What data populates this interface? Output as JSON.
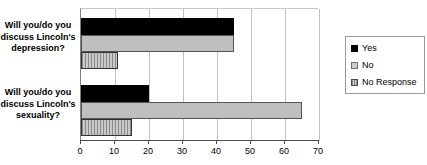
{
  "chart_data": {
    "type": "bar",
    "orientation": "horizontal",
    "title": "",
    "xlabel": "",
    "ylabel": "",
    "xlim": [
      0,
      70
    ],
    "xticks": [
      0,
      10,
      20,
      30,
      40,
      50,
      60,
      70
    ],
    "grid": true,
    "legend_position": "right",
    "categories": [
      "Will you/do you discuss Lincoln's depression?",
      "Will you/do you discuss Lincoln's sexuality?"
    ],
    "series": [
      {
        "name": "Yes",
        "color": "#000000",
        "values": [
          45,
          20
        ]
      },
      {
        "name": "No",
        "color": "#bfbfbf",
        "values": [
          45,
          65
        ]
      },
      {
        "name": "No Response",
        "color": "#c0c0c0",
        "values": [
          11,
          15
        ]
      }
    ]
  },
  "legend": {
    "entries": [
      {
        "label": "Yes"
      },
      {
        "label": "No"
      },
      {
        "label": "No Response"
      }
    ]
  },
  "axis": {
    "tick_labels": [
      "0",
      "10",
      "20",
      "30",
      "40",
      "50",
      "60",
      "70"
    ]
  }
}
